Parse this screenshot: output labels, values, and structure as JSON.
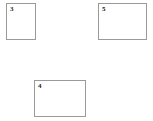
{
  "page": {
    "background_color": "#ffffff",
    "width": 153,
    "height": 121
  },
  "style": {
    "box_fill": "#ffffff",
    "box_border_color": "#9a9a9a",
    "box_border_width_px": 1,
    "label_color": "#1a1a1a",
    "label_font_size_px": 7
  },
  "boxes": [
    {
      "id": "box-3",
      "label": "3",
      "x": 6,
      "y": 3,
      "width": 30,
      "height": 37,
      "orientation": "portrait"
    },
    {
      "id": "box-5",
      "label": "5",
      "x": 98,
      "y": 3,
      "width": 49,
      "height": 37,
      "orientation": "landscape"
    },
    {
      "id": "box-4",
      "label": "4",
      "x": 34,
      "y": 80,
      "width": 52,
      "height": 37,
      "orientation": "landscape"
    }
  ]
}
